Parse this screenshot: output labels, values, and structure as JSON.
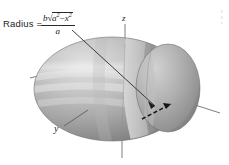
{
  "figure": {
    "background_color": "#ffffff",
    "width": 229,
    "height": 165
  },
  "annotation": {
    "radius_label": "Radius =",
    "formula_plain": "b*sqrt(a^2 - x^2) / a",
    "numerator": {
      "coefficient": "b",
      "radical_symbol": "√",
      "radicand_base": "a",
      "radicand_exponent": "2",
      "operator": "−",
      "radicand_base2": "x",
      "radicand_exponent2": "2"
    },
    "denominator": "a"
  },
  "axes": {
    "z_label": "z",
    "y_label": "y",
    "x_label": ""
  },
  "colors": {
    "ink": "#1b1b1b",
    "axis_line": "#6a6a6a",
    "leader_line": "#2e2e2e",
    "dashed_radius": "#141414",
    "surface_light": "#dcdcdc",
    "surface_mid": "#b4b4b4",
    "surface_dark": "#8e8e8e",
    "surface_shadow": "#787878",
    "band_light": "#cfcfcf",
    "band_dark": "#9a9a9a"
  },
  "elements": {
    "ellipsoid_name": "ellipsoid-surface",
    "slice_bands": 4,
    "dashed_radius_segment": "radius-measurement-dashed-line",
    "leader_from_formula": "formula-leader-line"
  }
}
